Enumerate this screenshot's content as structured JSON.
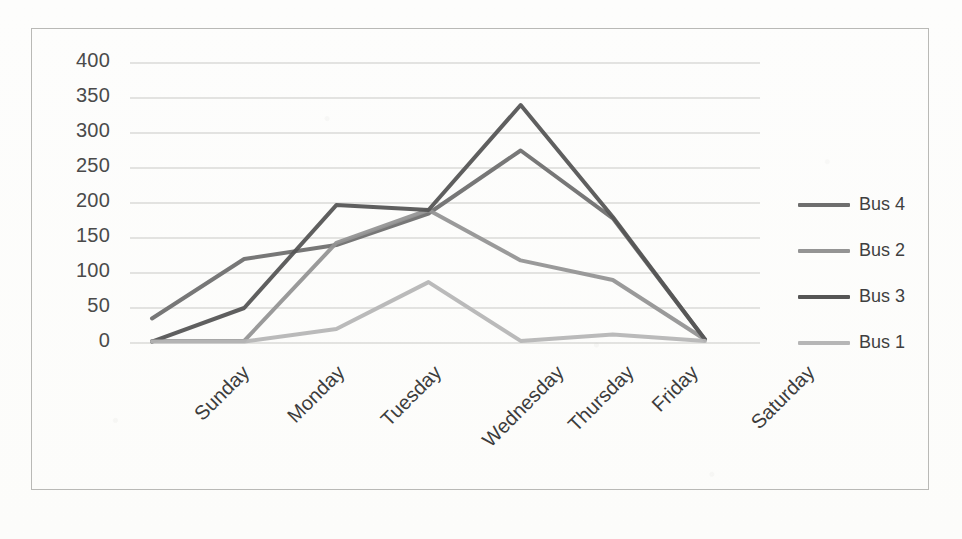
{
  "chart_data": {
    "type": "line",
    "title": "",
    "xlabel": "",
    "ylabel": "",
    "categories": [
      "Sunday",
      "Monday",
      "Tuesday",
      "Wednesday",
      "Thursday",
      "Friday",
      "Saturday"
    ],
    "ylim": [
      0,
      400
    ],
    "yticks": [
      0,
      50,
      100,
      150,
      200,
      250,
      300,
      350,
      400
    ],
    "grid": true,
    "legend_position": "right",
    "series": [
      {
        "name": "Bus 4",
        "color": "#6e6e6e",
        "values": [
          35,
          120,
          140,
          185,
          275,
          178,
          5
        ]
      },
      {
        "name": "Bus 2",
        "color": "#949494",
        "values": [
          3,
          3,
          143,
          190,
          118,
          90,
          5
        ]
      },
      {
        "name": "Bus 3",
        "color": "#555555",
        "values": [
          2,
          50,
          197,
          190,
          340,
          180,
          5
        ]
      },
      {
        "name": "Bus 1",
        "color": "#b6b6b6",
        "values": [
          2,
          2,
          20,
          87,
          3,
          12,
          3
        ]
      }
    ]
  },
  "axis": {
    "y_tick_labels": [
      "400",
      "350",
      "300",
      "250",
      "200",
      "150",
      "100",
      "50",
      "0"
    ],
    "x_tick_labels": [
      "Sunday",
      "Monday",
      "Tuesday",
      "Wednesday",
      "Thursday",
      "Friday",
      "Saturday"
    ]
  },
  "legend": {
    "items": [
      {
        "label": "Bus 4",
        "color": "#6e6e6e"
      },
      {
        "label": "Bus 2",
        "color": "#949494"
      },
      {
        "label": "Bus 3",
        "color": "#555555"
      },
      {
        "label": "Bus 1",
        "color": "#b6b6b6"
      }
    ]
  },
  "colors": {
    "gridline": "#c9c9c6",
    "frame": "#b9b9b6",
    "background": "#fdfdfc",
    "tick_text": "#4a4a4a"
  }
}
